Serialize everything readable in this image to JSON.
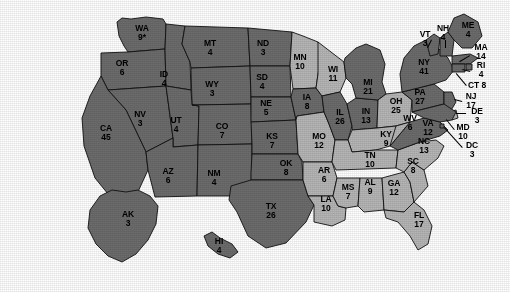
{
  "map": {
    "title": "United States Electoral College Map",
    "colors": {
      "background": "#ffffff",
      "shade_dark": "#6c6c6c",
      "shade_light": "#b6b6b6",
      "border": "#111111",
      "label_text": "#000000"
    },
    "legend_note": "WA 9*",
    "states": [
      {
        "code": "WA",
        "ev": "9*",
        "shade": "dark",
        "x": 142,
        "y": 33,
        "mode": "stack"
      },
      {
        "code": "OR",
        "ev": "6",
        "shade": "dark",
        "x": 122,
        "y": 68,
        "mode": "stack"
      },
      {
        "code": "CA",
        "ev": "45",
        "shade": "dark",
        "x": 106,
        "y": 133,
        "mode": "stack"
      },
      {
        "code": "NV",
        "ev": "3",
        "shade": "dark",
        "x": 140,
        "y": 119,
        "mode": "stack"
      },
      {
        "code": "ID",
        "ev": "4",
        "shade": "dark",
        "x": 164,
        "y": 79,
        "mode": "stack"
      },
      {
        "code": "MT",
        "ev": "4",
        "shade": "dark",
        "x": 210,
        "y": 48,
        "mode": "stack"
      },
      {
        "code": "WY",
        "ev": "3",
        "shade": "dark",
        "x": 212,
        "y": 89,
        "mode": "stack"
      },
      {
        "code": "UT",
        "ev": "4",
        "shade": "dark",
        "x": 176,
        "y": 125,
        "mode": "stack"
      },
      {
        "code": "AZ",
        "ev": "6",
        "shade": "dark",
        "x": 168,
        "y": 176,
        "mode": "stack"
      },
      {
        "code": "CO",
        "ev": "7",
        "shade": "dark",
        "x": 222,
        "y": 131,
        "mode": "stack"
      },
      {
        "code": "NM",
        "ev": "4",
        "shade": "dark",
        "x": 214,
        "y": 178,
        "mode": "stack"
      },
      {
        "code": "ND",
        "ev": "3",
        "shade": "dark",
        "x": 263,
        "y": 48,
        "mode": "stack"
      },
      {
        "code": "SD",
        "ev": "4",
        "shade": "dark",
        "x": 262,
        "y": 82,
        "mode": "stack"
      },
      {
        "code": "NE",
        "ev": "5",
        "shade": "dark",
        "x": 266,
        "y": 108,
        "mode": "stack"
      },
      {
        "code": "KS",
        "ev": "7",
        "shade": "dark",
        "x": 272,
        "y": 141,
        "mode": "stack"
      },
      {
        "code": "OK",
        "ev": "8",
        "shade": "dark",
        "x": 286,
        "y": 168,
        "mode": "stack"
      },
      {
        "code": "TX",
        "ev": "26",
        "shade": "dark",
        "x": 271,
        "y": 211,
        "mode": "stack"
      },
      {
        "code": "MN",
        "ev": "10",
        "shade": "light",
        "x": 300,
        "y": 62,
        "mode": "stack"
      },
      {
        "code": "IA",
        "ev": "8",
        "shade": "dark",
        "x": 307,
        "y": 102,
        "mode": "stack"
      },
      {
        "code": "MO",
        "ev": "12",
        "shade": "light",
        "x": 319,
        "y": 141,
        "mode": "stack"
      },
      {
        "code": "AR",
        "ev": "6",
        "shade": "light",
        "x": 324,
        "y": 175,
        "mode": "stack"
      },
      {
        "code": "LA",
        "ev": "10",
        "shade": "light",
        "x": 326,
        "y": 204,
        "mode": "stack"
      },
      {
        "code": "WI",
        "ev": "11",
        "shade": "light",
        "x": 333,
        "y": 74,
        "mode": "stack"
      },
      {
        "code": "IL",
        "ev": "26",
        "shade": "dark",
        "x": 340,
        "y": 117,
        "mode": "stack"
      },
      {
        "code": "MS",
        "ev": "7",
        "shade": "light",
        "x": 348,
        "y": 192,
        "mode": "stack"
      },
      {
        "code": "MI",
        "ev": "21",
        "shade": "dark",
        "x": 368,
        "y": 87,
        "mode": "stack"
      },
      {
        "code": "IN",
        "ev": "13",
        "shade": "dark",
        "x": 366,
        "y": 116,
        "mode": "stack"
      },
      {
        "code": "TN",
        "ev": "10",
        "shade": "light",
        "x": 370,
        "y": 160,
        "mode": "stack"
      },
      {
        "code": "AL",
        "ev": "9",
        "shade": "light",
        "x": 370,
        "y": 187,
        "mode": "stack"
      },
      {
        "code": "KY",
        "ev": "9",
        "shade": "light",
        "x": 386,
        "y": 139,
        "mode": "stack"
      },
      {
        "code": "GA",
        "ev": "12",
        "shade": "light",
        "x": 394,
        "y": 188,
        "mode": "stack"
      },
      {
        "code": "OH",
        "ev": "25",
        "shade": "light",
        "x": 396,
        "y": 106,
        "mode": "stack"
      },
      {
        "code": "WV",
        "ev": "6",
        "shade": "light",
        "x": 410,
        "y": 123,
        "mode": "stack"
      },
      {
        "code": "SC",
        "ev": "8",
        "shade": "light",
        "x": 413,
        "y": 166,
        "mode": "stack"
      },
      {
        "code": "NC",
        "ev": "13",
        "shade": "light",
        "x": 424,
        "y": 146,
        "mode": "stack"
      },
      {
        "code": "VA",
        "ev": "12",
        "shade": "dark",
        "x": 428,
        "y": 128,
        "mode": "stack"
      },
      {
        "code": "FL",
        "ev": "17",
        "shade": "light",
        "x": 419,
        "y": 220,
        "mode": "stack"
      },
      {
        "code": "PA",
        "ev": "27",
        "shade": "dark",
        "x": 420,
        "y": 97,
        "mode": "stack"
      },
      {
        "code": "NY",
        "ev": "41",
        "shade": "dark",
        "x": 424,
        "y": 67,
        "mode": "stack"
      },
      {
        "code": "VT",
        "ev": "3",
        "shade": "dark",
        "x": 425,
        "y": 39,
        "mode": "stack"
      },
      {
        "code": "NH",
        "ev": "4",
        "shade": "dark",
        "x": 443,
        "y": 33,
        "mode": "stack"
      },
      {
        "code": "ME",
        "ev": "4",
        "shade": "dark",
        "x": 468,
        "y": 30,
        "mode": "stack"
      },
      {
        "code": "MA",
        "ev": "14",
        "shade": "dark",
        "x": 481,
        "y": 52,
        "mode": "stack"
      },
      {
        "code": "RI",
        "ev": "4",
        "shade": "dark",
        "x": 481,
        "y": 70,
        "mode": "stack"
      },
      {
        "code": "CT",
        "ev": "8",
        "shade": "dark",
        "x": 477,
        "y": 85,
        "mode": "inline"
      },
      {
        "code": "NJ",
        "ev": "17",
        "shade": "dark",
        "x": 471,
        "y": 101,
        "mode": "stack"
      },
      {
        "code": "DE",
        "ev": "3",
        "shade": "light",
        "x": 477,
        "y": 116,
        "mode": "stack"
      },
      {
        "code": "MD",
        "ev": "10",
        "shade": "dark",
        "x": 463,
        "y": 132,
        "mode": "stack"
      },
      {
        "code": "DC",
        "ev": "3",
        "shade": "dark",
        "x": 472,
        "y": 150,
        "mode": "stack"
      },
      {
        "code": "AK",
        "ev": "3",
        "shade": "dark",
        "x": 128,
        "y": 219,
        "mode": "stack"
      },
      {
        "code": "HI",
        "ev": "4",
        "shade": "dark",
        "x": 219,
        "y": 246,
        "mode": "stack"
      }
    ]
  }
}
